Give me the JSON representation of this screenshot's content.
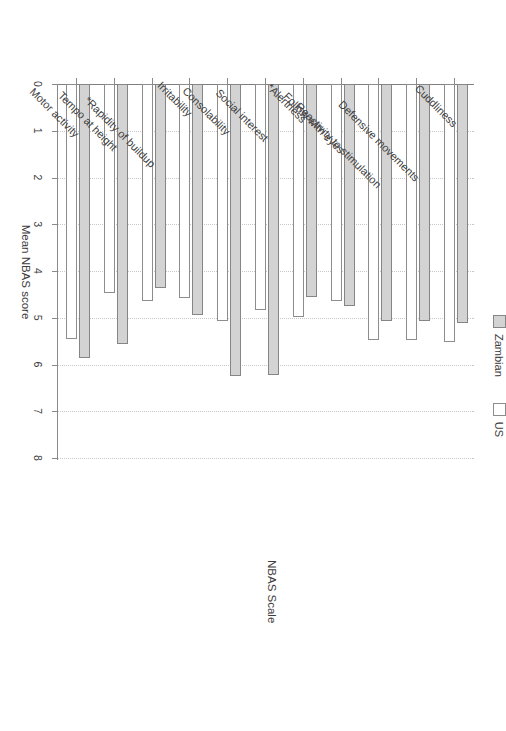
{
  "chart_data": {
    "type": "bar",
    "orientation": "horizontal",
    "title": "",
    "xlabel": "Mean NBAS score",
    "ylabel": "NBAS Scale",
    "xlim": [
      0,
      8
    ],
    "xticks": [
      "0",
      "1",
      "2",
      "3",
      "4",
      "5",
      "6",
      "7",
      "8"
    ],
    "grid": "dotted vertical gridlines at each integer",
    "legend_position": "top",
    "categories": [
      "Motor activity",
      "Tempo at height",
      "*Rapidity of buildup",
      "Irritability",
      "Consolability",
      "Social interest",
      "*Alertness",
      "Follow with eyes",
      "Reactivity to stimulation",
      "Defensive movements",
      "Cuddliness"
    ],
    "series": [
      {
        "name": "Zambian",
        "color": "#d3d3d3",
        "values": [
          5.86,
          5.56,
          4.36,
          4.94,
          6.25,
          6.22,
          4.55,
          4.75,
          5.08,
          5.07,
          5.11
        ]
      },
      {
        "name": "US",
        "color": "#ffffff",
        "values": [
          5.45,
          4.47,
          4.64,
          4.58,
          5.07,
          4.83,
          4.98,
          4.65,
          5.48,
          5.48,
          5.52
        ]
      }
    ]
  },
  "legend": {
    "items": [
      {
        "label": "Zambian",
        "swatch": "zambian"
      },
      {
        "label": "US",
        "swatch": "us"
      }
    ]
  },
  "axes": {
    "value_axis_title": "Mean NBAS score",
    "category_axis_title": "NBAS Scale"
  }
}
